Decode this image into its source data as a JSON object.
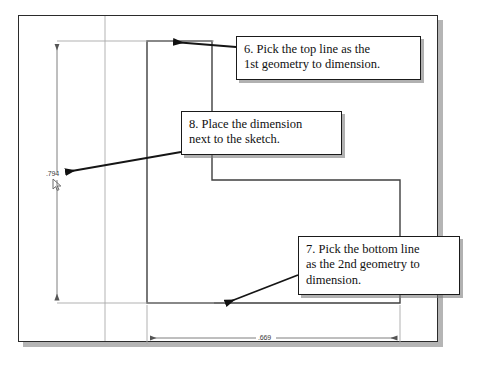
{
  "document": {
    "type": "cad-sketch-dimension-tutorial",
    "background_color": "#ffffff"
  },
  "cad_window": {
    "name": "drawing-area",
    "border_color": "#2b2b2b",
    "shadow_color": "#787878"
  },
  "sketch": {
    "name": "l-shaped-profile",
    "line_color": "#3a3a3a",
    "construction_color": "#9a9a9a",
    "description": "L-shaped closed profile sketch"
  },
  "dimensions": {
    "vertical": {
      "label": ".794",
      "name": "vertical-dimension",
      "orientation": "vertical"
    },
    "horizontal": {
      "label": ".669",
      "name": "horizontal-dimension",
      "orientation": "horizontal"
    }
  },
  "cursor": {
    "name": "mouse-cursor",
    "glyph": "arrow-pointer"
  },
  "callouts": [
    {
      "id": "callout-6",
      "name": "callout-step-6",
      "text": "6. Pick the top line as the\n1st geometry to dimension."
    },
    {
      "id": "callout-8",
      "name": "callout-step-8",
      "text": "8. Place the dimension\nnext to the sketch."
    },
    {
      "id": "callout-7",
      "name": "callout-step-7",
      "text": "7. Pick the bottom line\nas the 2nd geometry to\ndimension."
    }
  ],
  "arrows": [
    {
      "name": "arrow-to-top-line",
      "from": [
        236,
        47
      ],
      "to": [
        172,
        42
      ]
    },
    {
      "name": "arrow-to-dimension",
      "from": [
        181,
        152
      ],
      "to": [
        64,
        172
      ]
    },
    {
      "name": "arrow-to-bottom-line",
      "from": [
        298,
        275
      ],
      "to": [
        224,
        303
      ]
    }
  ]
}
